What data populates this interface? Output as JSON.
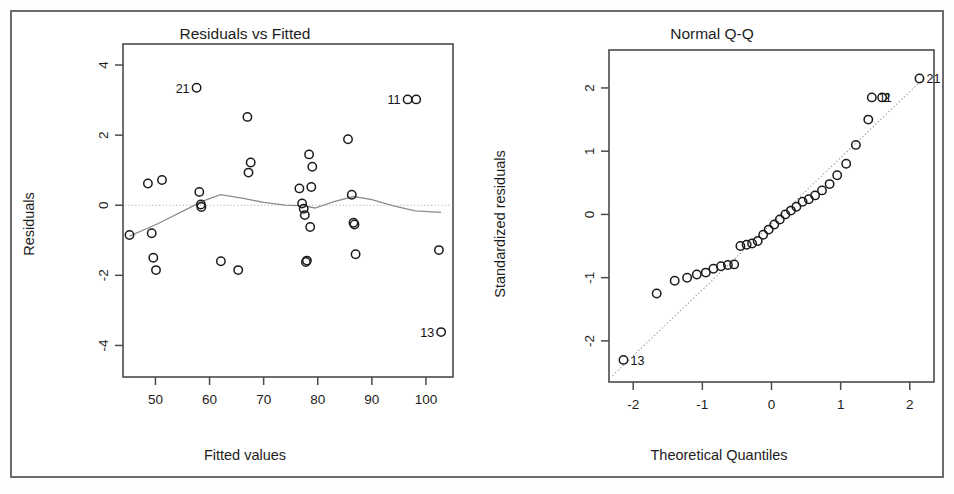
{
  "figure": {
    "background": "#ffffff",
    "frame_color": "#6b6b6b",
    "point_color": "#1a1a1a",
    "smoother_color": "#8c8c8c",
    "reference_line_color": "#b9a0a0"
  },
  "chart_data": [
    {
      "type": "scatter",
      "title": "Residuals vs Fitted",
      "xlabel": "Fitted values",
      "ylabel": "Residuals",
      "xlim": [
        44,
        105
      ],
      "ylim": [
        -4.9,
        4.6
      ],
      "xticks": [
        50,
        60,
        70,
        80,
        90,
        100
      ],
      "yticks": [
        4,
        2,
        0,
        -2,
        -4
      ],
      "grid": false,
      "legend": "none",
      "reference_line": {
        "kind": "horizontal",
        "y": 0,
        "style": "dotted"
      },
      "x": [
        45.2,
        48.6,
        49.3,
        49.6,
        50.1,
        51.2,
        57.6,
        58.1,
        58.4,
        58.5,
        62.1,
        65.3,
        67.0,
        67.2,
        67.6,
        76.6,
        77.1,
        77.4,
        77.6,
        77.8,
        78.0,
        78.4,
        78.6,
        78.8,
        79.0,
        85.6,
        86.3,
        86.6,
        86.8,
        87.0,
        96.6,
        98.2,
        102.4,
        102.8
      ],
      "y": [
        -0.85,
        0.62,
        -0.8,
        -1.5,
        -1.85,
        0.72,
        3.35,
        0.38,
        0.02,
        -0.05,
        -1.6,
        -1.85,
        2.52,
        0.93,
        1.22,
        0.48,
        0.05,
        -0.1,
        -0.28,
        -1.62,
        -1.58,
        1.45,
        -0.62,
        0.52,
        1.1,
        1.88,
        0.3,
        -0.5,
        -0.55,
        -1.4,
        3.02,
        3.02,
        -1.28,
        -3.62
      ],
      "labeled_points": [
        {
          "label": "21",
          "x": 57.6,
          "y": 3.35,
          "anchor": "right"
        },
        {
          "label": "11",
          "x": 96.6,
          "y": 3.02,
          "anchor": "right"
        },
        {
          "label": "13",
          "x": 102.8,
          "y": -3.62,
          "anchor": "right"
        }
      ],
      "smoother": {
        "kind": "lowess",
        "x": [
          45.2,
          50.5,
          56.0,
          58.5,
          62.0,
          66.0,
          70.0,
          74.0,
          77.5,
          79.5,
          83.0,
          86.6,
          90.0,
          94.0,
          98.0,
          102.8
        ],
        "y": [
          -0.88,
          -0.52,
          -0.1,
          0.1,
          0.3,
          0.2,
          0.08,
          0.0,
          -0.02,
          -0.08,
          0.1,
          0.25,
          0.16,
          -0.02,
          -0.16,
          -0.2
        ]
      }
    },
    {
      "type": "scatter",
      "title": "Normal Q-Q",
      "xlabel": "Theoretical Quantiles",
      "ylabel": "Standardized residuals",
      "xlim": [
        -2.35,
        2.35
      ],
      "ylim": [
        -2.65,
        2.6
      ],
      "xticks": [
        -2,
        -1,
        0,
        1,
        2
      ],
      "yticks": [
        2,
        1,
        0,
        -1,
        -2
      ],
      "grid": false,
      "legend": "none",
      "reference_line": {
        "kind": "qqline",
        "style": "dotted",
        "p1": [
          -2.3,
          -2.55
        ],
        "p2": [
          2.2,
          2.15
        ]
      },
      "x": [
        -2.14,
        -1.66,
        -1.4,
        -1.22,
        -1.08,
        -0.95,
        -0.84,
        -0.73,
        -0.63,
        -0.54,
        -0.45,
        -0.36,
        -0.28,
        -0.2,
        -0.12,
        -0.04,
        0.04,
        0.12,
        0.2,
        0.28,
        0.36,
        0.45,
        0.54,
        0.63,
        0.73,
        0.84,
        0.95,
        1.08,
        1.22,
        1.4,
        1.45,
        1.6,
        2.14
      ],
      "y": [
        -2.3,
        -1.25,
        -1.05,
        -1.0,
        -0.95,
        -0.92,
        -0.86,
        -0.82,
        -0.8,
        -0.79,
        -0.5,
        -0.48,
        -0.46,
        -0.42,
        -0.32,
        -0.24,
        -0.16,
        -0.08,
        0.0,
        0.06,
        0.12,
        0.2,
        0.24,
        0.3,
        0.38,
        0.48,
        0.62,
        0.8,
        1.1,
        1.5,
        1.85,
        1.85,
        2.15
      ],
      "labeled_points": [
        {
          "label": "13",
          "x": -2.14,
          "y": -2.3,
          "anchor": "left"
        },
        {
          "label": "21",
          "x": 2.14,
          "y": 2.15,
          "anchor": "left"
        },
        {
          "label": "11",
          "x": 1.45,
          "y": 1.85,
          "anchor": "left"
        },
        {
          "label": "2",
          "x": 1.52,
          "y": 1.85,
          "anchor": "left"
        }
      ]
    }
  ]
}
